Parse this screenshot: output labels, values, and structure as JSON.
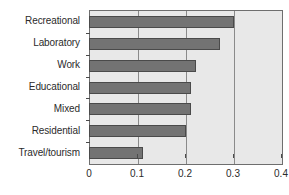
{
  "chart_data": {
    "type": "bar",
    "orientation": "horizontal",
    "title": "",
    "xlabel": "",
    "ylabel": "",
    "categories": [
      "Recreational",
      "Laboratory",
      "Work",
      "Educational",
      "Mixed",
      "Residential",
      "Travel/tourism"
    ],
    "values": [
      0.3,
      0.27,
      0.22,
      0.21,
      0.21,
      0.2,
      0.11
    ],
    "series": [
      {
        "name": "",
        "values": [
          0.3,
          0.27,
          0.22,
          0.21,
          0.21,
          0.2,
          0.11
        ]
      }
    ],
    "xlim": [
      0,
      0.4
    ],
    "xticks": [
      0,
      0.1,
      0.2,
      0.3,
      0.4
    ],
    "xtick_labels": [
      "0",
      "0.1",
      "0.2",
      "0.3",
      "0.4"
    ],
    "grid": true,
    "grid_axis": "x",
    "legend": false,
    "colors": {
      "bar_fill": "#737373",
      "bar_edge": "#4a4a4a",
      "plot_background": "#e8e8e8",
      "gridline": "#8a8a8a",
      "axis": "#6e6e6e",
      "text": "#2b2b2b",
      "page_background": "#ffffff"
    }
  }
}
